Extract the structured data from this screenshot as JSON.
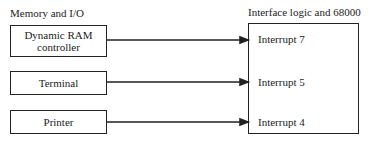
{
  "left_group": {
    "title": "Memory and I/O",
    "devices": [
      {
        "line1": "Dynamic RAM",
        "line2": "controller"
      },
      {
        "label": "Terminal"
      },
      {
        "label": "Printer"
      }
    ]
  },
  "right_group": {
    "title": "Interface logic and 68000",
    "interrupts": [
      "Interrupt 7",
      "Interrupt 5",
      "Interrupt 4"
    ]
  },
  "connections": [
    {
      "from": "Dynamic RAM controller",
      "to": "Interrupt 7"
    },
    {
      "from": "Terminal",
      "to": "Interrupt 5"
    },
    {
      "from": "Printer",
      "to": "Interrupt 4"
    }
  ]
}
